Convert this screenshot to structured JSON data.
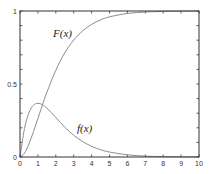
{
  "chart_data": {
    "type": "line",
    "title": "",
    "xlabel": "",
    "ylabel": "",
    "xlim": [
      0,
      10
    ],
    "ylim": [
      0,
      1
    ],
    "grid": false,
    "legend": "none (inline curve labels)",
    "x_ticks": [
      "0",
      "1",
      "2",
      "3",
      "4",
      "5",
      "6",
      "7",
      "8",
      "9",
      "10"
    ],
    "y_ticks": [
      "0",
      "0.5",
      "1"
    ],
    "x": [
      0,
      0.25,
      0.5,
      0.75,
      1,
      1.25,
      1.5,
      2,
      2.5,
      3,
      3.5,
      4,
      4.5,
      5,
      6,
      7,
      8,
      9,
      10
    ],
    "series": [
      {
        "name": "F(x)",
        "values": [
          0,
          0.026,
          0.09,
          0.173,
          0.264,
          0.355,
          0.442,
          0.594,
          0.713,
          0.801,
          0.864,
          0.908,
          0.939,
          0.96,
          0.983,
          0.993,
          0.997,
          0.999,
          1.0
        ]
      },
      {
        "name": "f(x)",
        "values": [
          0,
          0.195,
          0.303,
          0.354,
          0.368,
          0.358,
          0.335,
          0.271,
          0.205,
          0.149,
          0.106,
          0.073,
          0.05,
          0.034,
          0.015,
          0.006,
          0.003,
          0.001,
          0.0005
        ]
      }
    ],
    "annotations": [
      {
        "text": "F(x)",
        "x": 1.6,
        "y": 0.78
      },
      {
        "text": "f(x)",
        "x": 3.2,
        "y": 0.2
      }
    ]
  },
  "labels": {
    "F": "F(x)",
    "f": "f(x)"
  },
  "colors": {
    "axis": "#333333",
    "curve": "#8c8c8c"
  }
}
